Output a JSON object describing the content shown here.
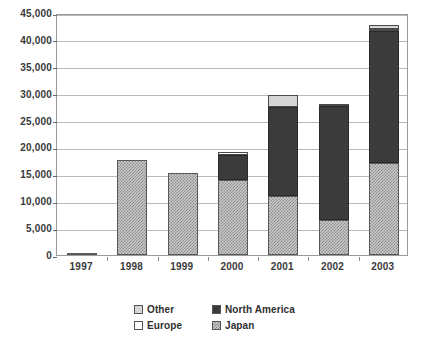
{
  "chart_data": {
    "type": "bar",
    "subtype": "stacked-column",
    "title": "",
    "subtitle": "",
    "xlabel": "",
    "ylabel": "",
    "categories": [
      "1997",
      "1998",
      "1999",
      "2000",
      "2001",
      "2002",
      "2003"
    ],
    "series": [
      {
        "name": "Japan",
        "key": "japan",
        "swatch": "checkered",
        "color": "#c9c9c9",
        "values": [
          300,
          17700,
          15300,
          14000,
          11000,
          6500,
          17100
        ]
      },
      {
        "name": "North America",
        "key": "northamerica",
        "swatch": "solid-dark",
        "color": "#3b3b3b",
        "values": [
          0,
          0,
          0,
          4600,
          16500,
          21200,
          24500
        ]
      },
      {
        "name": "Europe",
        "key": "europe",
        "swatch": "white",
        "color": "#ffffff",
        "values": [
          0,
          0,
          0,
          600,
          0,
          300,
          500
        ]
      },
      {
        "name": "Other",
        "key": "other",
        "swatch": "light-gray",
        "color": "#d6d6d6",
        "values": [
          0,
          0,
          0,
          0,
          2300,
          0,
          700
        ]
      }
    ],
    "stack_order": [
      "japan",
      "northamerica",
      "europe",
      "other"
    ],
    "totals": [
      300,
      17700,
      15300,
      19200,
      29800,
      28000,
      42800
    ],
    "ylim": [
      0,
      45000
    ],
    "ytick_values": [
      0,
      5000,
      10000,
      15000,
      20000,
      25000,
      30000,
      35000,
      40000,
      45000
    ],
    "ytick_labels": [
      "0",
      "5,000",
      "10,000",
      "15,000",
      "20,000",
      "25,000",
      "30,000",
      "35,000",
      "40,000",
      "45,000"
    ],
    "grid": true,
    "grid_axis": "y",
    "legend_position": "bottom",
    "legend_entries": [
      "Other",
      "North America",
      "Europe",
      "Japan"
    ],
    "annotations": []
  },
  "legend": {
    "rows": [
      {
        "entries": [
          {
            "label": "Other",
            "key": "other"
          },
          {
            "label": "North America",
            "key": "northamerica"
          }
        ]
      },
      {
        "entries": [
          {
            "label": "Europe",
            "key": "europe"
          },
          {
            "label": "Japan",
            "key": "japan"
          }
        ]
      }
    ]
  }
}
